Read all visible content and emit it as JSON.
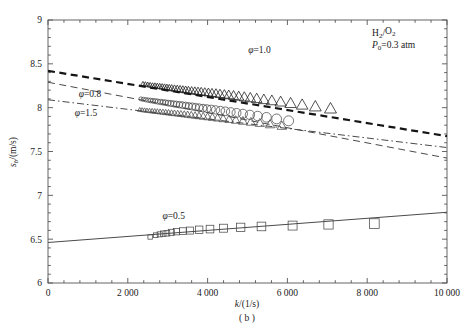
{
  "figure": {
    "caption": "( b )",
    "annotations": {
      "mixture": "H2/O2",
      "mixture_parts": {
        "base1": "H",
        "sub1": "2",
        "slash": "/",
        "base2": "O",
        "sub2": "2"
      },
      "pressure_symbol": "P",
      "pressure_sub": "0",
      "pressure_value": "=0.3 atm"
    }
  },
  "chart_data": {
    "type": "scatter",
    "title": "",
    "xlabel": "k/(1/s)",
    "ylabel": "s_b/(m/s)",
    "xlabel_parts": {
      "italic": "k",
      "rest": "/(1/s)"
    },
    "ylabel_parts": {
      "italic": "s",
      "sub": "b",
      "rest": "/(m/s)"
    },
    "xlim": [
      0,
      10000
    ],
    "ylim": [
      6,
      9
    ],
    "xticks": [
      0,
      2000,
      4000,
      6000,
      8000,
      10000
    ],
    "xticklabels": [
      "0",
      "2 000",
      "4 000",
      "6 000",
      "8 000",
      "10 000"
    ],
    "yticks": [
      6,
      6.5,
      7,
      7.5,
      8,
      8.5,
      9
    ],
    "yticklabels": [
      "6",
      "6.5",
      "7",
      "7.5",
      "8",
      "8.5",
      "9"
    ],
    "x_minor_count": 4,
    "y_minor_count": 4,
    "grid": false,
    "legend_position": "inline-annotations",
    "series": [
      {
        "name": "phi=1.0",
        "label": "φ=1.0",
        "label_parts": {
          "symbol": "φ",
          "value": "=1.0"
        },
        "marker": "triangle",
        "marker_open": true,
        "linestyle": "dashed-thick",
        "color": "#1a1a1a",
        "fit": {
          "intercept": 8.42,
          "slope": -7.45e-05
        },
        "fit_endpoints": [
          [
            0,
            8.42
          ],
          [
            10000,
            7.675
          ]
        ],
        "label_xy": [
          5300,
          8.62
        ],
        "points": [
          [
            2380,
            8.27
          ],
          [
            2440,
            8.265
          ],
          [
            2500,
            8.26
          ],
          [
            2560,
            8.255
          ],
          [
            2620,
            8.25
          ],
          [
            2680,
            8.248
          ],
          [
            2740,
            8.244
          ],
          [
            2800,
            8.24
          ],
          [
            2860,
            8.236
          ],
          [
            2920,
            8.232
          ],
          [
            2980,
            8.228
          ],
          [
            3040,
            8.224
          ],
          [
            3100,
            8.22
          ],
          [
            3170,
            8.216
          ],
          [
            3240,
            8.212
          ],
          [
            3310,
            8.208
          ],
          [
            3380,
            8.203
          ],
          [
            3450,
            8.199
          ],
          [
            3520,
            8.195
          ],
          [
            3600,
            8.19
          ],
          [
            3680,
            8.186
          ],
          [
            3760,
            8.182
          ],
          [
            3840,
            8.178
          ],
          [
            3930,
            8.173
          ],
          [
            4020,
            8.168
          ],
          [
            4110,
            8.163
          ],
          [
            4210,
            8.158
          ],
          [
            4310,
            8.152
          ],
          [
            4420,
            8.146
          ],
          [
            4530,
            8.14
          ],
          [
            4650,
            8.133
          ],
          [
            4780,
            8.125
          ],
          [
            4920,
            8.117
          ],
          [
            5070,
            8.108
          ],
          [
            5230,
            8.099
          ],
          [
            5410,
            8.088
          ],
          [
            5610,
            8.076
          ],
          [
            5830,
            8.062
          ],
          [
            6080,
            8.046
          ],
          [
            6370,
            8.028
          ],
          [
            6700,
            8.008
          ],
          [
            7080,
            7.985
          ]
        ]
      },
      {
        "name": "phi=0.8",
        "label": "φ=0.8",
        "label_parts": {
          "symbol": "φ",
          "value": "=0.8"
        },
        "marker": "circle",
        "marker_open": true,
        "linestyle": "dashed-thin",
        "color": "#4a4a4a",
        "fit": {
          "intercept": 8.29,
          "slope": -8.65e-05
        },
        "fit_endpoints": [
          [
            0,
            8.29
          ],
          [
            10000,
            7.425
          ]
        ],
        "label_xy": [
          1050,
          8.12
        ],
        "points": [
          [
            2330,
            8.1
          ],
          [
            2390,
            8.095
          ],
          [
            2450,
            8.09
          ],
          [
            2510,
            8.086
          ],
          [
            2570,
            8.082
          ],
          [
            2630,
            8.078
          ],
          [
            2690,
            8.074
          ],
          [
            2750,
            8.07
          ],
          [
            2815,
            8.065
          ],
          [
            2880,
            8.061
          ],
          [
            2945,
            8.057
          ],
          [
            3010,
            8.052
          ],
          [
            3080,
            8.048
          ],
          [
            3150,
            8.043
          ],
          [
            3220,
            8.038
          ],
          [
            3295,
            8.034
          ],
          [
            3370,
            8.029
          ],
          [
            3450,
            8.024
          ],
          [
            3530,
            8.018
          ],
          [
            3615,
            8.013
          ],
          [
            3700,
            8.007
          ],
          [
            3790,
            8.001
          ],
          [
            3885,
            7.995
          ],
          [
            3985,
            7.989
          ],
          [
            4090,
            7.982
          ],
          [
            4200,
            7.975
          ],
          [
            4320,
            7.967
          ],
          [
            4445,
            7.959
          ],
          [
            4580,
            7.95
          ],
          [
            4725,
            7.94
          ],
          [
            4885,
            7.93
          ],
          [
            5060,
            7.918
          ],
          [
            5255,
            7.905
          ],
          [
            5475,
            7.89
          ],
          [
            5730,
            7.872
          ],
          [
            6030,
            7.85
          ]
        ]
      },
      {
        "name": "phi=1.5",
        "label": "φ=1.5",
        "label_parts": {
          "symbol": "φ",
          "value": "=1.5"
        },
        "marker": "triangle-small",
        "marker_open": true,
        "linestyle": "dash-dot",
        "color": "#4a4a4a",
        "fit": {
          "intercept": 8.09,
          "slope": -5.45e-05
        },
        "fit_endpoints": [
          [
            0,
            8.09
          ],
          [
            10000,
            7.545
          ]
        ],
        "label_xy": [
          950,
          7.9
        ],
        "points": [
          [
            2300,
            7.975
          ],
          [
            2360,
            7.972
          ],
          [
            2420,
            7.969
          ],
          [
            2480,
            7.966
          ],
          [
            2545,
            7.963
          ],
          [
            2610,
            7.96
          ],
          [
            2675,
            7.957
          ],
          [
            2740,
            7.954
          ],
          [
            2810,
            7.951
          ],
          [
            2880,
            7.948
          ],
          [
            2950,
            7.944
          ],
          [
            3020,
            7.941
          ],
          [
            3095,
            7.937
          ],
          [
            3170,
            7.934
          ],
          [
            3250,
            7.93
          ],
          [
            3330,
            7.926
          ],
          [
            3415,
            7.922
          ],
          [
            3500,
            7.918
          ],
          [
            3590,
            7.913
          ],
          [
            3685,
            7.908
          ],
          [
            3785,
            7.903
          ],
          [
            3890,
            7.898
          ],
          [
            4000,
            7.892
          ],
          [
            4120,
            7.886
          ],
          [
            4250,
            7.879
          ],
          [
            4390,
            7.872
          ],
          [
            4540,
            7.864
          ],
          [
            4705,
            7.855
          ],
          [
            4885,
            7.845
          ],
          [
            5085,
            7.834
          ],
          [
            5310,
            7.821
          ],
          [
            5565,
            7.806
          ],
          [
            5860,
            7.789
          ]
        ]
      },
      {
        "name": "phi=0.5",
        "label": "φ=0.5",
        "label_parts": {
          "symbol": "φ",
          "value": "=0.5"
        },
        "marker": "square",
        "marker_open": true,
        "linestyle": "solid",
        "color": "#4a4a4a",
        "fit": {
          "intercept": 6.462,
          "slope": 3.45e-05
        },
        "fit_endpoints": [
          [
            0,
            6.462
          ],
          [
            10000,
            6.807
          ]
        ],
        "label_xy": [
          3150,
          6.73
        ],
        "points": [
          [
            2560,
            6.525
          ],
          [
            2700,
            6.545
          ],
          [
            2800,
            6.555
          ],
          [
            2890,
            6.563
          ],
          [
            2980,
            6.568
          ],
          [
            3090,
            6.578
          ],
          [
            3220,
            6.585
          ],
          [
            3380,
            6.592
          ],
          [
            3560,
            6.598
          ],
          [
            3790,
            6.608
          ],
          [
            4060,
            6.615
          ],
          [
            4400,
            6.625
          ],
          [
            4830,
            6.635
          ],
          [
            5350,
            6.645
          ],
          [
            6130,
            6.655
          ],
          [
            7030,
            6.668
          ],
          [
            8180,
            6.678
          ]
        ]
      }
    ]
  }
}
